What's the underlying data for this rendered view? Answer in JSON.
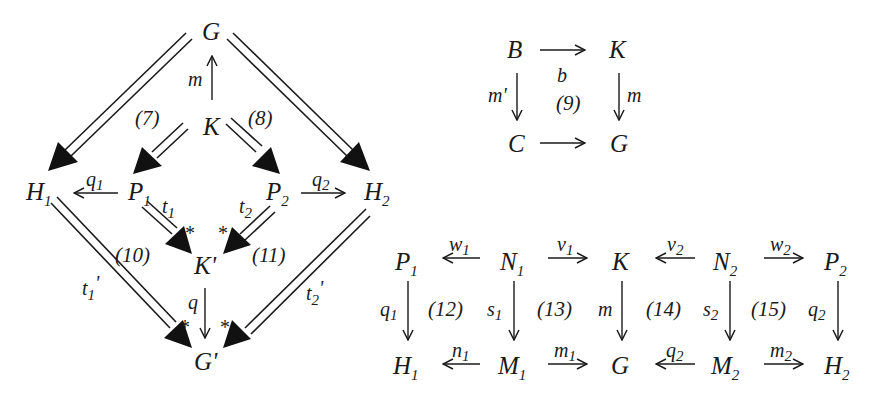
{
  "diagram_main": {
    "nodes": {
      "G": {
        "base": "G",
        "sub": ""
      },
      "K": {
        "base": "K",
        "sub": ""
      },
      "H1": {
        "base": "H",
        "sub": "1"
      },
      "P1": {
        "base": "P",
        "sub": "1"
      },
      "P2": {
        "base": "P",
        "sub": "2"
      },
      "H2": {
        "base": "H",
        "sub": "2"
      },
      "Kp": {
        "base": "K'",
        "sub": ""
      },
      "Gp": {
        "base": "G'",
        "sub": ""
      }
    },
    "arrows": {
      "m": {
        "base": "m",
        "sub": "",
        "from": "K",
        "to": "G"
      },
      "q1": {
        "base": "q",
        "sub": "1",
        "from": "P1",
        "to": "H1"
      },
      "q2": {
        "base": "q",
        "sub": "2",
        "from": "P2",
        "to": "H2"
      },
      "t1": {
        "base": "t",
        "sub": "1",
        "from": "P1",
        "to": "K'"
      },
      "t2": {
        "base": "t",
        "sub": "2",
        "from": "P2",
        "to": "K'"
      },
      "t1p": {
        "base": "t",
        "sub": "1",
        "prime": "'",
        "from": "H1",
        "to": "G'"
      },
      "t2p": {
        "base": "t",
        "sub": "2",
        "prime": "'",
        "from": "H2",
        "to": "G'"
      },
      "q": {
        "base": "q",
        "sub": "",
        "from": "K'",
        "to": "G'"
      }
    },
    "squares": {
      "s7": "(7)",
      "s8": "(8)",
      "s10": "(10)",
      "s11": "(11)"
    },
    "star": "*"
  },
  "diagram_square9": {
    "nodes": {
      "B": "B",
      "K": "K",
      "C": "C",
      "G": "G"
    },
    "arrows": {
      "b": {
        "label": "b",
        "from": "B",
        "to": "K"
      },
      "mp": {
        "label": "m'",
        "from": "B",
        "to": "C"
      },
      "m": {
        "label": "m",
        "from": "K",
        "to": "G"
      },
      "cg": {
        "label": "",
        "from": "C",
        "to": "G"
      }
    },
    "square": "(9)"
  },
  "diagram_bottom": {
    "top_row": [
      {
        "base": "P",
        "sub": "1"
      },
      {
        "base": "N",
        "sub": "1"
      },
      {
        "base": "K",
        "sub": ""
      },
      {
        "base": "N",
        "sub": "2"
      },
      {
        "base": "P",
        "sub": "2"
      }
    ],
    "bottom_row": [
      {
        "base": "H",
        "sub": "1"
      },
      {
        "base": "M",
        "sub": "1"
      },
      {
        "base": "G",
        "sub": ""
      },
      {
        "base": "M",
        "sub": "2"
      },
      {
        "base": "H",
        "sub": "2"
      }
    ],
    "top_arrows": [
      {
        "base": "w",
        "sub": "1",
        "dir": "left"
      },
      {
        "base": "v",
        "sub": "1",
        "dir": "right"
      },
      {
        "base": "v",
        "sub": "2",
        "dir": "left"
      },
      {
        "base": "w",
        "sub": "2",
        "dir": "right"
      }
    ],
    "bottom_arrows": [
      {
        "base": "n",
        "sub": "1",
        "dir": "left"
      },
      {
        "base": "m",
        "sub": "1",
        "dir": "right"
      },
      {
        "base": "q",
        "sub": "2",
        "dir": "left"
      },
      {
        "base": "m",
        "sub": "2",
        "dir": "right"
      }
    ],
    "vertical_arrows": [
      {
        "base": "q",
        "sub": "1"
      },
      {
        "base": "s",
        "sub": "1"
      },
      {
        "base": "m",
        "sub": ""
      },
      {
        "base": "s",
        "sub": "2"
      },
      {
        "base": "q",
        "sub": "2"
      }
    ],
    "squares": [
      "(12)",
      "(13)",
      "(14)",
      "(15)"
    ]
  }
}
